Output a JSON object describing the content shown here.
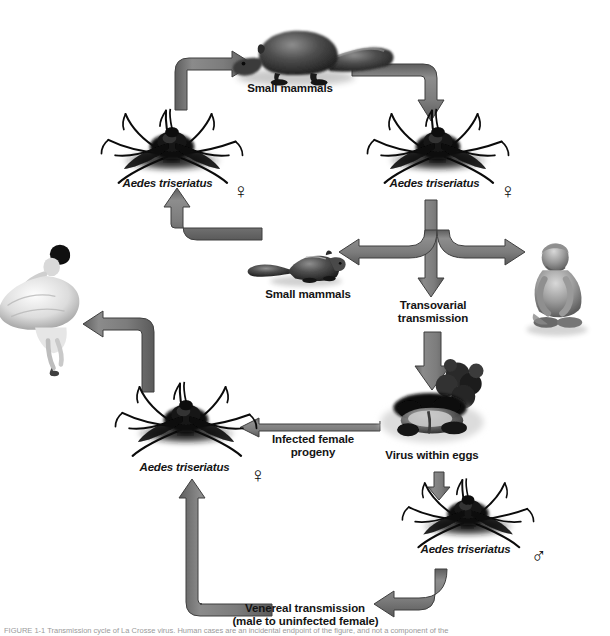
{
  "figure": {
    "caption": "FIGURE 1-1  Transmission cycle of La Crosse virus. Human cases are an incidental endpoint of the figure, and not a component of the",
    "width": 610,
    "height": 636,
    "background": "#ffffff",
    "arrow_fill": "#808080",
    "arrow_stroke": "#4a4a4a",
    "text_color": "#141414"
  },
  "nodes": [
    {
      "id": "squirrel-top",
      "label": "Small mammals",
      "icon": "squirrel-icon",
      "x": 290,
      "y": 85
    },
    {
      "id": "mosquito-upper-left",
      "label": "Aedes triseriatus",
      "sex": "♀",
      "sex_name": "female-symbol",
      "icon": "mosquito-icon",
      "x": 172,
      "y": 182
    },
    {
      "id": "mosquito-upper-right",
      "label": "Aedes triseriatus",
      "sex": "♀",
      "sex_name": "female-symbol",
      "icon": "mosquito-icon",
      "x": 438,
      "y": 182
    },
    {
      "id": "chipmunk-middle",
      "label": "Small mammals",
      "icon": "chipmunk-icon",
      "x": 308,
      "y": 293
    },
    {
      "id": "child",
      "label": "",
      "icon": "child-icon",
      "x": 545,
      "y": 252
    },
    {
      "id": "transovarial",
      "label": "Transovarial\ntransmission",
      "line1": "Transovarial",
      "line2": "transmission",
      "icon": "down-arrow-icon",
      "x": 438,
      "y": 305
    },
    {
      "id": "eggs",
      "label": "Virus within eggs",
      "icon": "eggs-in-container-icon",
      "x": 438,
      "y": 455
    },
    {
      "id": "mosquito-lower-left",
      "label": "Aedes triseriatus",
      "sex": "♀",
      "sex_name": "female-symbol",
      "icon": "mosquito-icon",
      "x": 188,
      "y": 458
    },
    {
      "id": "mosquito-lower-right",
      "label": "Aedes triseriatus",
      "sex": "♂",
      "sex_name": "male-symbol",
      "icon": "mosquito-icon",
      "x": 470,
      "y": 547
    },
    {
      "id": "woman",
      "label": "",
      "icon": "dancing-woman-icon",
      "x": 52,
      "y": 315
    }
  ],
  "edges": [
    {
      "id": "edge-ul-mosquito-to-squirrel",
      "label": "",
      "from": "mosquito-upper-left",
      "to": "squirrel-top"
    },
    {
      "id": "edge-squirrel-to-ur-mosquito",
      "label": "",
      "from": "squirrel-top",
      "to": "mosquito-upper-right"
    },
    {
      "id": "edge-ur-mosquito-to-chipmunk",
      "label": "",
      "from": "mosquito-upper-right",
      "to": "chipmunk-middle"
    },
    {
      "id": "edge-ur-mosquito-to-child",
      "label": "",
      "from": "mosquito-upper-right",
      "to": "child"
    },
    {
      "id": "edge-ur-mosquito-to-transovarial",
      "label": "",
      "from": "mosquito-upper-right",
      "to": "transovarial"
    },
    {
      "id": "edge-chipmunk-to-ul-mosquito",
      "label": "",
      "from": "chipmunk-middle",
      "to": "mosquito-upper-left"
    },
    {
      "id": "edge-transovarial-to-eggs",
      "label": "",
      "from": "transovarial",
      "to": "eggs"
    },
    {
      "id": "edge-eggs-to-ll-mosquito",
      "label": "Infected female\nprogeny",
      "line1": "Infected female",
      "line2": "progeny",
      "from": "eggs",
      "to": "mosquito-lower-left"
    },
    {
      "id": "edge-eggs-to-lr-mosquito",
      "label": "",
      "from": "eggs",
      "to": "mosquito-lower-right"
    },
    {
      "id": "edge-lr-to-ll-mosquito",
      "label": "Venereal transmission\n(male to uninfected female)",
      "line1": "Venereal transmission",
      "line2": "(male to uninfected female)",
      "from": "mosquito-lower-right",
      "to": "mosquito-lower-left"
    },
    {
      "id": "edge-ll-mosquito-to-woman",
      "label": "",
      "from": "mosquito-lower-left",
      "to": "woman"
    }
  ],
  "labels": {
    "small_mammals_top": "Small mammals",
    "small_mammals_middle": "Small mammals",
    "aedes_upper_left": "Aedes triseriatus",
    "aedes_upper_right": "Aedes triseriatus",
    "aedes_lower_left": "Aedes triseriatus",
    "aedes_lower_right": "Aedes triseriatus",
    "transovarial_line1": "Transovarial",
    "transovarial_line2": "transmission",
    "virus_within_eggs": "Virus within eggs",
    "infected_progeny_line1": "Infected female",
    "infected_progeny_line2": "progeny",
    "venereal_line1": "Venereal transmission",
    "venereal_line2": "(male to uninfected female)",
    "female_symbol": "♀",
    "male_symbol": "♂"
  }
}
